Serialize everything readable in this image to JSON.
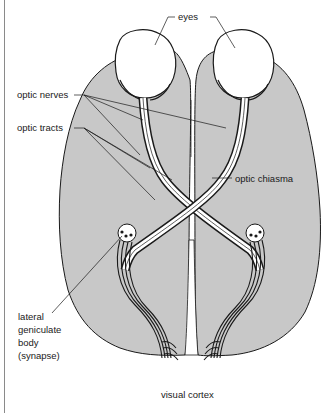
{
  "diagram": {
    "labels": {
      "eyes": "eyes",
      "optic_nerves": "optic nerves",
      "optic_tracts": "optic tracts",
      "optic_chiasma": "optic chiasma",
      "lgb_line1": "lateral",
      "lgb_line2": "geniculate",
      "lgb_line3": "body",
      "lgb_line4": "(synapse)",
      "visual_cortex": "visual cortex"
    },
    "colors": {
      "brain_fill": "#c8c8c8",
      "outline": "#1a1a1a",
      "eye_fill": "#ffffff",
      "background": "#ffffff"
    }
  }
}
